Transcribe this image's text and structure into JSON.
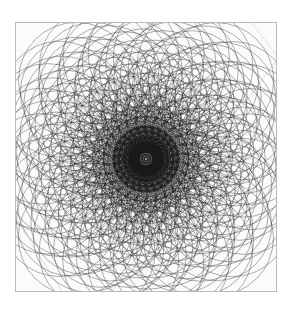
{
  "figure": {
    "kind": "spirograph-rosette",
    "background_color": "#ffffff",
    "panel_color": "#fbfbfb",
    "frame_color": "#b9b9b9",
    "stroke_color": "#1a1a1a",
    "guide_color": "#cfcfcf"
  },
  "frame": {
    "x": 15,
    "y": 22,
    "width": 262,
    "height": 270
  },
  "chart_data": {
    "type": "scatter",
    "xlabel": "",
    "ylabel": "",
    "center_x": 130,
    "center_y": 136,
    "outer_radius": 116,
    "petal_count": 26,
    "ring_count": 13,
    "circle_radius": 58,
    "ring_radii": [
      9,
      17,
      25,
      33,
      41,
      49,
      57,
      65,
      73,
      81,
      89,
      97,
      105
    ],
    "rotation_step_deg": 5.2,
    "circles_total": 338,
    "stroke_width": 0.55,
    "stroke_opacity": 0.72,
    "grid": false,
    "legend": "none",
    "xlim": [
      -131,
      131
    ],
    "ylim": [
      -135,
      135
    ]
  },
  "guides": {
    "corner_lines": [
      {
        "x1": 236,
        "y1": 0,
        "x2": 262,
        "y2": 34
      },
      {
        "x1": 262,
        "y1": 36,
        "x2": 230,
        "y2": 78
      },
      {
        "x1": 0,
        "y1": 196,
        "x2": 46,
        "y2": 268
      },
      {
        "x1": 96,
        "y1": 268,
        "x2": 122,
        "y2": 232
      },
      {
        "x1": 0,
        "y1": 42,
        "x2": 28,
        "y2": 14
      }
    ],
    "axis_lines": [
      {
        "x1": 0,
        "y1": 136,
        "x2": 262,
        "y2": 136
      },
      {
        "x1": 130,
        "y1": 0,
        "x2": 130,
        "y2": 268
      }
    ]
  }
}
